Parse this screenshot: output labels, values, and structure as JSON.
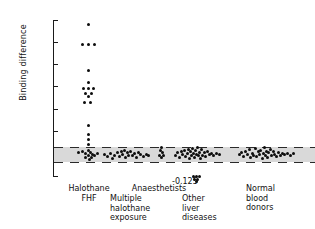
{
  "chart_data": {
    "type": "scatter",
    "title": "",
    "xlabel": "",
    "ylabel": "Binding difference",
    "ylim": [
      -0.1,
      0.6
    ],
    "grid": false,
    "legend": "none",
    "yticks": [
      0.6,
      0.5,
      0.4,
      0.3,
      0.2,
      0.1,
      0,
      -0.1
    ],
    "ytick_labels": [
      "0.6",
      "0.5",
      "0.4",
      "0.3",
      "0.2",
      "0.1",
      "0",
      "-0.1"
    ],
    "reference_band": {
      "label": "normal range band",
      "upper": 0.03,
      "lower": -0.035,
      "fill": "#d9d9d9",
      "edge_style": "dashed"
    },
    "annotations": [
      {
        "text": "-0.125",
        "x_group": "Other liver diseases",
        "y": -0.125
      }
    ],
    "categories": [
      "Halothane FHF",
      "Multiple halothane exposure",
      "Anaesthetists",
      "Other liver diseases",
      "Normal blood donors"
    ],
    "series": [
      {
        "name": "Halothane FHF",
        "x_center": 88,
        "points": [
          {
            "dx": 0,
            "y": 0.58
          },
          {
            "dx": -6,
            "y": 0.492
          },
          {
            "dx": 0,
            "y": 0.492
          },
          {
            "dx": 6,
            "y": 0.492
          },
          {
            "dx": 0,
            "y": 0.375
          },
          {
            "dx": 0,
            "y": 0.318
          },
          {
            "dx": -5,
            "y": 0.292
          },
          {
            "dx": 0,
            "y": 0.292
          },
          {
            "dx": 5,
            "y": 0.292
          },
          {
            "dx": -3,
            "y": 0.272
          },
          {
            "dx": 3,
            "y": 0.272
          },
          {
            "dx": 0,
            "y": 0.258
          },
          {
            "dx": -4,
            "y": 0.228
          },
          {
            "dx": 2,
            "y": 0.228
          },
          {
            "dx": 0,
            "y": 0.128
          },
          {
            "dx": 0,
            "y": 0.088
          },
          {
            "dx": 0,
            "y": 0.062
          },
          {
            "dx": 0,
            "y": 0.04
          },
          {
            "dx": -10,
            "y": 0.005
          },
          {
            "dx": -6,
            "y": 0.01
          },
          {
            "dx": -3,
            "y": 0.002
          },
          {
            "dx": 0,
            "y": 0.014
          },
          {
            "dx": 2,
            "y": 0.006
          },
          {
            "dx": 4,
            "y": -0.004
          },
          {
            "dx": 0,
            "y": -0.01
          },
          {
            "dx": -3,
            "y": -0.016
          },
          {
            "dx": 3,
            "y": -0.018
          },
          {
            "dx": 6,
            "y": -0.006
          },
          {
            "dx": 9,
            "y": 0.0
          },
          {
            "dx": 1,
            "y": -0.026
          }
        ]
      },
      {
        "name": "Multiple halothane exposure",
        "x_center": 126,
        "points": [
          {
            "dx": -22,
            "y": -0.004
          },
          {
            "dx": -19,
            "y": -0.014
          },
          {
            "dx": -16,
            "y": 0.002
          },
          {
            "dx": -14,
            "y": -0.02
          },
          {
            "dx": -12,
            "y": -0.008
          },
          {
            "dx": -9,
            "y": 0.006
          },
          {
            "dx": -7,
            "y": -0.012
          },
          {
            "dx": -5,
            "y": 0.012
          },
          {
            "dx": -4,
            "y": -0.002
          },
          {
            "dx": -2,
            "y": 0.016
          },
          {
            "dx": -1,
            "y": -0.018
          },
          {
            "dx": 1,
            "y": 0.004
          },
          {
            "dx": 2,
            "y": -0.01
          },
          {
            "dx": 4,
            "y": 0.01
          },
          {
            "dx": 6,
            "y": -0.006
          },
          {
            "dx": 8,
            "y": 0.0
          },
          {
            "dx": 10,
            "y": -0.016
          },
          {
            "dx": 12,
            "y": 0.006
          },
          {
            "dx": 14,
            "y": -0.004
          },
          {
            "dx": 17,
            "y": -0.012
          },
          {
            "dx": 20,
            "y": -0.002
          },
          {
            "dx": 22,
            "y": -0.008
          }
        ]
      },
      {
        "name": "Anaesthetists",
        "x_center": 161,
        "points": [
          {
            "dx": 0,
            "y": 0.03
          },
          {
            "dx": -1,
            "y": 0.016
          },
          {
            "dx": 1,
            "y": 0.004
          },
          {
            "dx": -2,
            "y": -0.006
          },
          {
            "dx": 2,
            "y": -0.008
          },
          {
            "dx": 0,
            "y": -0.016
          }
        ]
      },
      {
        "name": "Other liver diseases",
        "x_center": 195,
        "points": [
          {
            "dx": -20,
            "y": -0.006
          },
          {
            "dx": -18,
            "y": 0.004
          },
          {
            "dx": -16,
            "y": -0.016
          },
          {
            "dx": -14,
            "y": 0.01
          },
          {
            "dx": -13,
            "y": -0.004
          },
          {
            "dx": -11,
            "y": 0.016
          },
          {
            "dx": -10,
            "y": -0.012
          },
          {
            "dx": -8,
            "y": 0.0
          },
          {
            "dx": -7,
            "y": 0.02
          },
          {
            "dx": -6,
            "y": -0.02
          },
          {
            "dx": -5,
            "y": 0.008
          },
          {
            "dx": -4,
            "y": -0.006
          },
          {
            "dx": -3,
            "y": 0.024
          },
          {
            "dx": -2,
            "y": 0.002
          },
          {
            "dx": -1,
            "y": -0.016
          },
          {
            "dx": 0,
            "y": 0.014
          },
          {
            "dx": 1,
            "y": -0.002
          },
          {
            "dx": 2,
            "y": 0.026
          },
          {
            "dx": 3,
            "y": -0.01
          },
          {
            "dx": 4,
            "y": 0.006
          },
          {
            "dx": 5,
            "y": -0.022
          },
          {
            "dx": 6,
            "y": 0.018
          },
          {
            "dx": 7,
            "y": -0.006
          },
          {
            "dx": 9,
            "y": 0.004
          },
          {
            "dx": 10,
            "y": -0.014
          },
          {
            "dx": 12,
            "y": 0.01
          },
          {
            "dx": 14,
            "y": -0.002
          },
          {
            "dx": 16,
            "y": 0.0
          },
          {
            "dx": 18,
            "y": -0.008
          },
          {
            "dx": 21,
            "y": 0.002
          },
          {
            "dx": 24,
            "y": -0.004
          },
          {
            "dx": -2,
            "y": -0.104
          },
          {
            "dx": 1,
            "y": -0.104
          },
          {
            "dx": 4,
            "y": -0.104
          },
          {
            "dx": -1,
            "y": -0.114
          },
          {
            "dx": 2,
            "y": -0.114
          },
          {
            "dx": 1,
            "y": -0.126
          }
        ]
      },
      {
        "name": "Normal blood donors",
        "x_center": 265,
        "points": [
          {
            "dx": -26,
            "y": -0.004
          },
          {
            "dx": -24,
            "y": 0.006
          },
          {
            "dx": -22,
            "y": -0.014
          },
          {
            "dx": -20,
            "y": 0.012
          },
          {
            "dx": -18,
            "y": -0.002
          },
          {
            "dx": -16,
            "y": 0.018
          },
          {
            "dx": -15,
            "y": -0.018
          },
          {
            "dx": -13,
            "y": 0.002
          },
          {
            "dx": -12,
            "y": -0.008
          },
          {
            "dx": -10,
            "y": 0.022
          },
          {
            "dx": -9,
            "y": -0.012
          },
          {
            "dx": -7,
            "y": 0.008
          },
          {
            "dx": -6,
            "y": -0.004
          },
          {
            "dx": -5,
            "y": 0.016
          },
          {
            "dx": -3,
            "y": -0.02
          },
          {
            "dx": -2,
            "y": 0.0
          },
          {
            "dx": -1,
            "y": 0.026
          },
          {
            "dx": 0,
            "y": -0.01
          },
          {
            "dx": 1,
            "y": 0.01
          },
          {
            "dx": 2,
            "y": -0.016
          },
          {
            "dx": 3,
            "y": 0.004
          },
          {
            "dx": 5,
            "y": 0.02
          },
          {
            "dx": 6,
            "y": -0.006
          },
          {
            "dx": 8,
            "y": 0.012
          },
          {
            "dx": 9,
            "y": -0.002
          },
          {
            "dx": 11,
            "y": -0.014
          },
          {
            "dx": 13,
            "y": 0.006
          },
          {
            "dx": 15,
            "y": -0.008
          },
          {
            "dx": 17,
            "y": 0.002
          },
          {
            "dx": 19,
            "y": -0.004
          },
          {
            "dx": 22,
            "y": 0.0
          },
          {
            "dx": 25,
            "y": -0.006
          },
          {
            "dx": 28,
            "y": 0.002
          }
        ]
      }
    ]
  },
  "axis": {
    "y_label": "Binding difference"
  },
  "group_labels": [
    {
      "id": "halothane-fhf",
      "text": "Halothane\nFHF",
      "left": 58,
      "top": 184,
      "width": 62,
      "align": "center"
    },
    {
      "id": "anaesthetists",
      "text": "Anaesthetists",
      "left": 124,
      "top": 184,
      "width": 70,
      "align": "center"
    },
    {
      "id": "multiple-halothane",
      "text": "Multiple\nhalothane\nexposure",
      "left": 110,
      "top": 194,
      "width": 60,
      "align": "left"
    },
    {
      "id": "other-liver-diseases",
      "text": "Other\nliver\ndiseases",
      "left": 182,
      "top": 194,
      "width": 60,
      "align": "left"
    },
    {
      "id": "normal-blood-donors",
      "text": "Normal\nblood\ndonors",
      "left": 246,
      "top": 184,
      "width": 60,
      "align": "left"
    }
  ]
}
